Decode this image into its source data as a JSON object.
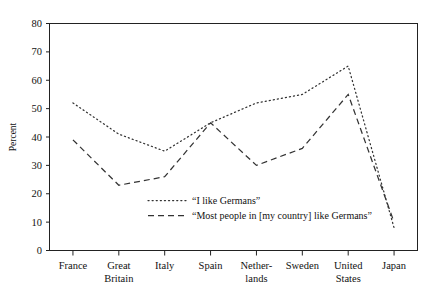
{
  "chart_data": {
    "type": "line",
    "title": "",
    "xlabel": "",
    "ylabel": "Percent",
    "ylim": [
      0,
      80
    ],
    "ytick_step": 10,
    "grid": false,
    "legend_position": "inside-bottom-center",
    "categories": [
      "France",
      "Great Britain",
      "Italy",
      "Spain",
      "Netherlands",
      "Sweden",
      "United States",
      "Japan"
    ],
    "category_lines": [
      [
        "France"
      ],
      [
        "Great",
        "Britain"
      ],
      [
        "Italy"
      ],
      [
        "Spain"
      ],
      [
        "Nether-",
        "lands"
      ],
      [
        "Sweden"
      ],
      [
        "United",
        "States"
      ],
      [
        "Japan"
      ]
    ],
    "yticks": [
      "0",
      "10",
      "20",
      "30",
      "40",
      "50",
      "60",
      "70",
      "80"
    ],
    "series": [
      {
        "name": "“I like Germans”",
        "style": "dotted",
        "color": "#333333",
        "values": [
          52,
          41,
          35,
          45,
          52,
          55,
          65,
          8
        ]
      },
      {
        "name": "“Most people in [my country] like Germans”",
        "style": "dashed",
        "color": "#333333",
        "values": [
          39,
          23,
          26,
          45,
          30,
          36,
          55,
          10
        ]
      }
    ]
  },
  "axes": {
    "y_label": "Percent"
  },
  "legend": {
    "entry_1_label": "“I like Germans”",
    "entry_2_label": "“Most people in [my country] like Germans”"
  }
}
